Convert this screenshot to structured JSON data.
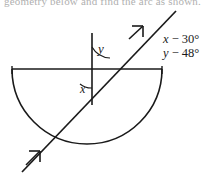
{
  "figure": {
    "top_cut_text": "geometry below and find the arc as shown.",
    "labels": {
      "angle_y": "y",
      "angle_x": "x"
    },
    "annotations": [
      {
        "id": "x-expression",
        "text": "x − 30°",
        "var": "x",
        "rest": " − 30°"
      },
      {
        "id": "y-expression",
        "text": "y − 48°",
        "var": "y",
        "rest": " − 48°"
      }
    ],
    "colors": {
      "stroke": "#1a1a1a",
      "background": "#ffffff",
      "text": "#1a1a1a"
    },
    "geometry": {
      "center_x": 92,
      "center_y": 69,
      "diameter_left_x": 12,
      "diameter_right_x": 162,
      "semicircle_bottom_y": 143,
      "vertical_top_y": 33,
      "vertical_bottom_y": 105,
      "ray_start": [
        22,
        172
      ],
      "ray_end": [
        176,
        11
      ]
    }
  }
}
